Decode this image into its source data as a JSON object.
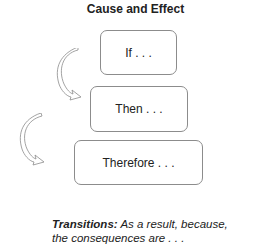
{
  "title": "Cause and Effect",
  "steps": [
    {
      "label": "If . . ."
    },
    {
      "label": "Then . . ."
    },
    {
      "label": "Therefore . . ."
    }
  ],
  "caption": {
    "heading": "Transitions:",
    "line1": " As a result, because,",
    "line2": "the consequences are . . ."
  }
}
